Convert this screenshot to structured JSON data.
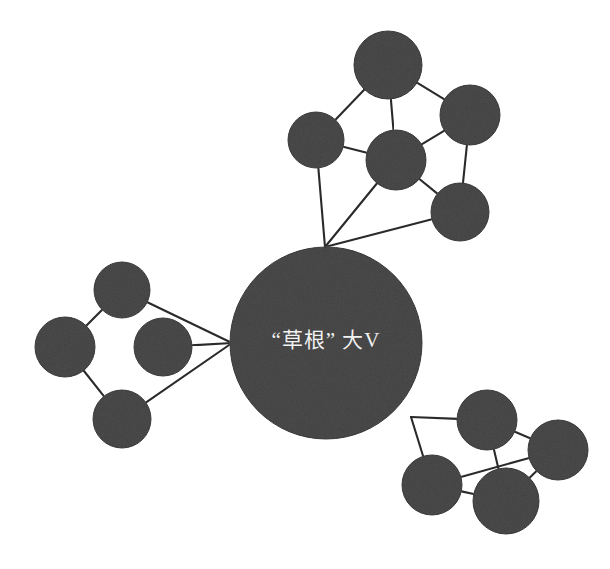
{
  "figure": {
    "kind": "network-graph",
    "background_color": "#ffffff",
    "node_fill_color": "#4c4c4c",
    "node_stroke_color": "#3a3a3a",
    "edge_color": "#2b2b2b",
    "label_color": "#f2f2f2",
    "width": 610,
    "height": 569
  },
  "hub": {
    "id": "hub",
    "label": "“草根” 大V",
    "cx": 326,
    "cy": 343,
    "r": 96
  },
  "clusters": [
    {
      "name": "top-cluster",
      "nodes": [
        {
          "id": "t1",
          "cx": 388,
          "cy": 65,
          "r": 34
        },
        {
          "id": "t2",
          "cx": 470,
          "cy": 115,
          "r": 30
        },
        {
          "id": "t3",
          "cx": 316,
          "cy": 140,
          "r": 28
        },
        {
          "id": "t4",
          "cx": 396,
          "cy": 160,
          "r": 30
        },
        {
          "id": "t5",
          "cx": 460,
          "cy": 212,
          "r": 29
        }
      ]
    },
    {
      "name": "left-cluster",
      "nodes": [
        {
          "id": "l1",
          "cx": 122,
          "cy": 290,
          "r": 28
        },
        {
          "id": "l2",
          "cx": 65,
          "cy": 347,
          "r": 30
        },
        {
          "id": "l3",
          "cx": 163,
          "cy": 347,
          "r": 29
        },
        {
          "id": "l4",
          "cx": 122,
          "cy": 419,
          "r": 29
        }
      ]
    },
    {
      "name": "bottom-right-cluster",
      "nodes": [
        {
          "id": "b1",
          "cx": 487,
          "cy": 420,
          "r": 30
        },
        {
          "id": "b2",
          "cx": 558,
          "cy": 450,
          "r": 30
        },
        {
          "id": "b3",
          "cx": 432,
          "cy": 485,
          "r": 30
        },
        {
          "id": "b4",
          "cx": 506,
          "cy": 501,
          "r": 33
        }
      ]
    }
  ],
  "edges": [
    {
      "from": "t1",
      "to": "t3"
    },
    {
      "from": "t1",
      "to": "t2"
    },
    {
      "from": "t1",
      "to": "t4"
    },
    {
      "from": "t2",
      "to": "t4"
    },
    {
      "from": "t2",
      "to": "t5"
    },
    {
      "from": "t3",
      "to": "t4"
    },
    {
      "from": "t4",
      "to": "t5"
    },
    {
      "from": "t3",
      "to": "hub-top"
    },
    {
      "from": "t4",
      "to": "hub-top"
    },
    {
      "from": "t5",
      "to": "hub-top"
    },
    {
      "from": "l1",
      "to": "l2"
    },
    {
      "from": "l2",
      "to": "l3"
    },
    {
      "from": "l2",
      "to": "l4"
    },
    {
      "from": "l1",
      "to": "hub-left"
    },
    {
      "from": "l3",
      "to": "hub-left"
    },
    {
      "from": "l4",
      "to": "hub-left"
    },
    {
      "from": "b1",
      "to": "hub-right"
    },
    {
      "from": "b3",
      "to": "hub-right"
    },
    {
      "from": "b1",
      "to": "b2"
    },
    {
      "from": "b1",
      "to": "b4"
    },
    {
      "from": "b2",
      "to": "b4"
    },
    {
      "from": "b3",
      "to": "b2"
    },
    {
      "from": "b3",
      "to": "b4"
    }
  ],
  "hub_anchors": {
    "hub-top": {
      "x": 325,
      "y": 247
    },
    "hub-left": {
      "x": 232,
      "y": 343
    },
    "hub-right": {
      "x": 411,
      "y": 417
    }
  }
}
